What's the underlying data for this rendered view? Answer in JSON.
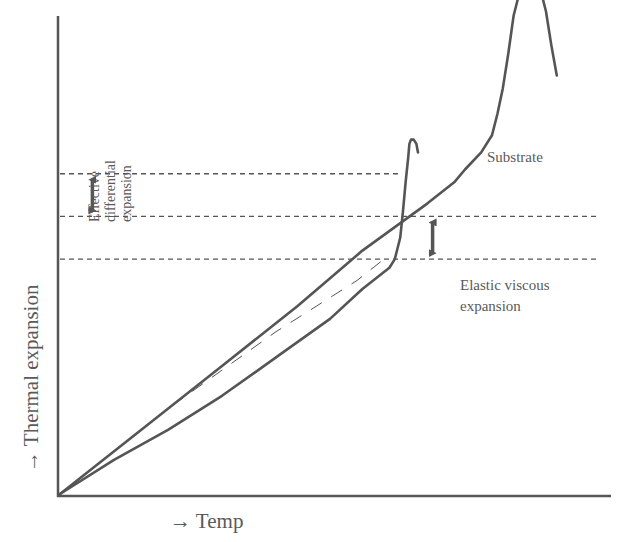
{
  "diagram": {
    "x_axis_label": "→ Temp",
    "y_axis_label": "→ Thermal expansion",
    "curve_label": "Substrate",
    "left_annotation": [
      "Effective",
      "differential",
      "expansion"
    ],
    "right_annotation": [
      "Elastic viscous",
      "expansion"
    ],
    "colors": {
      "line": "#555555",
      "dashed": "#555555",
      "text": "#5a5a5a"
    }
  },
  "chart_data": {
    "type": "line",
    "title": "",
    "xlabel": "→ Temp",
    "ylabel": "→ Thermal expansion",
    "grid": false,
    "units": "qualitative (normalized 0–100 scale, no ticks shown)",
    "xlim": [
      0,
      100
    ],
    "ylim": [
      0,
      100
    ],
    "series": [
      {
        "name": "Substrate",
        "style": "solid",
        "points": [
          [
            0,
            0
          ],
          [
            16,
            16
          ],
          [
            30,
            30
          ],
          [
            44,
            44
          ],
          [
            56,
            57
          ],
          [
            68,
            68
          ],
          [
            73,
            73
          ],
          [
            75,
            76
          ],
          [
            78,
            80
          ],
          [
            80,
            84
          ],
          [
            81,
            89
          ],
          [
            82,
            95
          ],
          [
            83,
            103
          ],
          [
            84,
            112
          ],
          [
            85,
            117
          ],
          [
            86,
            121
          ],
          [
            87,
            122
          ],
          [
            88,
            121
          ],
          [
            89,
            118
          ],
          [
            90,
            113
          ],
          [
            91,
            105
          ],
          [
            92,
            98
          ]
        ]
      },
      {
        "name": "Glaze",
        "style": "solid",
        "points": [
          [
            0,
            0
          ],
          [
            10,
            8
          ],
          [
            20,
            15
          ],
          [
            30,
            23
          ],
          [
            40,
            32
          ],
          [
            50,
            41
          ],
          [
            56,
            48
          ],
          [
            60,
            52
          ],
          [
            61,
            53
          ],
          [
            62,
            55
          ],
          [
            63,
            60
          ],
          [
            63.5,
            66
          ],
          [
            64,
            73
          ],
          [
            64.5,
            79
          ],
          [
            64.7,
            82
          ],
          [
            65,
            83
          ],
          [
            65.5,
            83
          ],
          [
            66,
            82
          ],
          [
            66.3,
            80
          ]
        ]
      },
      {
        "name": "Glaze (reference)",
        "style": "dashed",
        "points": [
          [
            0,
            0
          ],
          [
            20,
            20
          ],
          [
            40,
            38
          ],
          [
            55,
            50
          ],
          [
            60,
            55
          ]
        ]
      }
    ],
    "reference_lines": [
      {
        "y": 75,
        "style": "dashed",
        "x_range": [
          0,
          63
        ]
      },
      {
        "y": 65,
        "style": "dashed",
        "x_range": [
          0,
          100
        ]
      },
      {
        "y": 55,
        "style": "dashed",
        "x_range": [
          0,
          100
        ]
      }
    ],
    "annotations": [
      {
        "text": "Effective differential expansion",
        "between_y": [
          65,
          75
        ],
        "x": 6,
        "type": "double-arrow"
      },
      {
        "text": "Elastic viscous expansion",
        "between_y": [
          55,
          65
        ],
        "x": 69,
        "type": "double-arrow"
      },
      {
        "text": "Substrate",
        "near_series": "Substrate"
      }
    ]
  }
}
